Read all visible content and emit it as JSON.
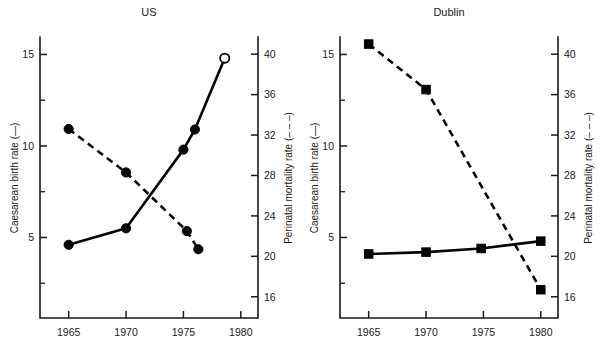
{
  "figure": {
    "background": "#ffffff",
    "ink_color": "#050505",
    "width": 600,
    "height": 352
  },
  "axis_titles": {
    "left": "Caesarean birth rate (",
    "left_suffix": ")",
    "right": "Perinatal mortality rate (",
    "right_suffix": ")"
  },
  "chart_data": [
    {
      "type": "line",
      "title": "US",
      "xlabel": "",
      "ylabel": "Caesarean birth rate",
      "y2label": "Perinatal mortality rate",
      "grid": false,
      "legend": "inline-axis-titles",
      "xlim": [
        1962.5,
        1981.5
      ],
      "xticks": [
        1965,
        1970,
        1975,
        1980
      ],
      "xtick_labels": [
        "1965",
        "1970",
        "1975",
        "1980"
      ],
      "ylim": [
        0.6,
        15.9
      ],
      "yticks": [
        5,
        10,
        15
      ],
      "ytick_labels": [
        "5",
        "10",
        "15"
      ],
      "yminorticks": [
        2.5,
        7.5,
        12.5
      ],
      "y2lim": [
        13.9,
        41.6
      ],
      "y2ticks": [
        16,
        20,
        24,
        28,
        32,
        36,
        40
      ],
      "y2tick_labels": [
        "16",
        "20",
        "24",
        "28",
        "32",
        "36",
        "40"
      ],
      "series": [
        {
          "name": "Caesarean birth rate",
          "axis": "left",
          "linestyle": "solid",
          "marker": "circle",
          "x": [
            1965,
            1970,
            1975,
            1976,
            1978.6
          ],
          "values": [
            4.6,
            5.5,
            9.8,
            10.9,
            14.8
          ],
          "marker_fill": [
            "filled",
            "filled",
            "filled",
            "filled",
            "open"
          ]
        },
        {
          "name": "Perinatal mortality rate",
          "axis": "right",
          "linestyle": "dashed",
          "marker": "circle",
          "x": [
            1965,
            1970,
            1975.3,
            1976.3
          ],
          "values": [
            32.6,
            28.3,
            22.5,
            20.7
          ],
          "marker_fill": [
            "filled",
            "filled",
            "filled",
            "filled"
          ]
        }
      ]
    },
    {
      "type": "line",
      "title": "Dublin",
      "xlabel": "",
      "ylabel": "Caesarean birth rate",
      "y2label": "Perinatal mortality rate",
      "grid": false,
      "legend": "inline-axis-titles",
      "xlim": [
        1962.5,
        1981.5
      ],
      "xticks": [
        1965,
        1970,
        1975,
        1980
      ],
      "xtick_labels": [
        "1965",
        "1970",
        "1975",
        "1980"
      ],
      "ylim": [
        0.6,
        15.9
      ],
      "yticks": [
        5,
        10,
        15
      ],
      "ytick_labels": [
        "5",
        "10",
        "15"
      ],
      "yminorticks": [
        2.5,
        7.5,
        12.5
      ],
      "y2lim": [
        13.9,
        41.6
      ],
      "y2ticks": [
        16,
        20,
        24,
        28,
        32,
        36,
        40
      ],
      "y2tick_labels": [
        "16",
        "20",
        "24",
        "28",
        "32",
        "36",
        "40"
      ],
      "series": [
        {
          "name": "Caesarean birth rate",
          "axis": "left",
          "linestyle": "solid",
          "marker": "square",
          "x": [
            1965,
            1970,
            1974.8,
            1980
          ],
          "values": [
            4.1,
            4.2,
            4.4,
            4.8
          ],
          "marker_fill": [
            "filled",
            "filled",
            "filled",
            "filled"
          ]
        },
        {
          "name": "Perinatal mortality rate",
          "axis": "right",
          "linestyle": "dashed",
          "marker": "square",
          "x": [
            1965,
            1970,
            1980
          ],
          "values": [
            41.0,
            36.5,
            16.7
          ],
          "marker_fill": [
            "filled",
            "filled",
            "filled"
          ]
        }
      ]
    }
  ]
}
